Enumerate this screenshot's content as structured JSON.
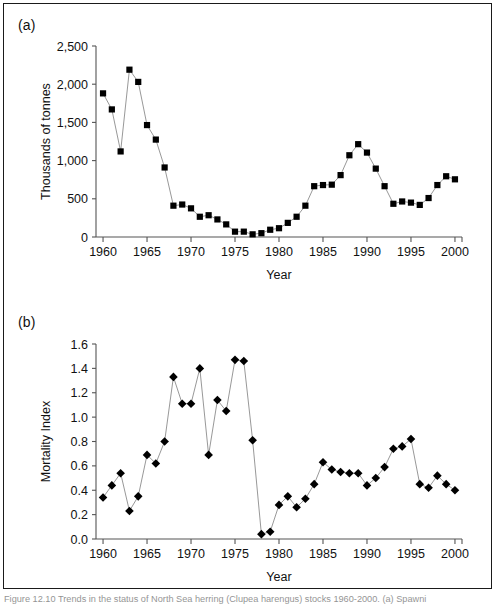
{
  "figure": {
    "caption": "Figure 12.10   Trends in the status of North Sea herring (Clupea harengus) stocks 1960-2000.   (a) Spawni",
    "panel_a_label": "(a)",
    "panel_b_label": "(b)"
  },
  "chart_data": [
    {
      "type": "line",
      "panel": "(a)",
      "title": "",
      "xlabel": "Year",
      "ylabel": "Thousands of tonnes",
      "xlim": [
        1959.2,
        2000.8
      ],
      "ylim": [
        0,
        2500
      ],
      "ytick_labels": [
        "0",
        "500",
        "1,000",
        "1,500",
        "2,000",
        "2,500"
      ],
      "yticks": [
        0,
        500,
        1000,
        1500,
        2000,
        2500
      ],
      "xticks": [
        1960,
        1965,
        1970,
        1975,
        1980,
        1985,
        1990,
        1995,
        2000
      ],
      "xtick_labels": [
        "1960",
        "1965",
        "1970",
        "1975",
        "1980",
        "1985",
        "1990",
        "1995",
        "2000"
      ],
      "grid": false,
      "legend": "none",
      "marker": "square",
      "x": [
        1960,
        1961,
        1962,
        1963,
        1964,
        1965,
        1966,
        1967,
        1968,
        1969,
        1970,
        1971,
        1972,
        1973,
        1974,
        1975,
        1976,
        1977,
        1978,
        1979,
        1980,
        1981,
        1982,
        1983,
        1984,
        1985,
        1986,
        1987,
        1988,
        1989,
        1990,
        1991,
        1992,
        1993,
        1994,
        1995,
        1996,
        1997,
        1998,
        1999,
        2000
      ],
      "values": [
        1880,
        1670,
        1120,
        2190,
        2030,
        1465,
        1275,
        910,
        410,
        425,
        375,
        265,
        285,
        230,
        165,
        70,
        70,
        35,
        50,
        95,
        115,
        185,
        265,
        410,
        665,
        680,
        685,
        810,
        1070,
        1215,
        1105,
        895,
        665,
        435,
        465,
        450,
        420,
        510,
        680,
        795,
        755
      ]
    },
    {
      "type": "line",
      "panel": "(b)",
      "title": "",
      "xlabel": "Year",
      "ylabel": "Mortality Index",
      "xlim": [
        1959.2,
        2000.8
      ],
      "ylim": [
        0.0,
        1.6
      ],
      "ytick_labels": [
        "0.0",
        "0.2",
        "0.4",
        "0.6",
        "0.8",
        "1.0",
        "1.2",
        "1.4",
        "1.6"
      ],
      "yticks": [
        0.0,
        0.2,
        0.4,
        0.6,
        0.8,
        1.0,
        1.2,
        1.4,
        1.6
      ],
      "xticks": [
        1960,
        1965,
        1970,
        1975,
        1980,
        1985,
        1990,
        1995,
        2000
      ],
      "xtick_labels": [
        "1960",
        "1965",
        "1970",
        "1975",
        "1980",
        "1985",
        "1990",
        "1995",
        "2000"
      ],
      "grid": false,
      "legend": "none",
      "marker": "diamond",
      "x": [
        1960,
        1961,
        1962,
        1963,
        1964,
        1965,
        1966,
        1967,
        1968,
        1969,
        1970,
        1971,
        1972,
        1973,
        1974,
        1975,
        1976,
        1977,
        1978,
        1979,
        1980,
        1981,
        1982,
        1983,
        1984,
        1985,
        1986,
        1987,
        1988,
        1989,
        1990,
        1991,
        1992,
        1993,
        1994,
        1995,
        1996,
        1997,
        1998,
        1999,
        2000
      ],
      "values": [
        0.34,
        0.44,
        0.54,
        0.23,
        0.35,
        0.69,
        0.62,
        0.8,
        1.33,
        1.11,
        1.11,
        1.4,
        0.69,
        1.14,
        1.05,
        1.47,
        1.46,
        0.81,
        0.04,
        0.06,
        0.28,
        0.35,
        0.26,
        0.33,
        0.45,
        0.63,
        0.57,
        0.55,
        0.54,
        0.54,
        0.44,
        0.5,
        0.59,
        0.74,
        0.76,
        0.82,
        0.45,
        0.42,
        0.52,
        0.45,
        0.4
      ]
    }
  ],
  "colors": {
    "line": "#8c8c8c",
    "marker": "#000000",
    "axis": "#555555",
    "text": "#111111",
    "frame": "#1a1a1a"
  }
}
